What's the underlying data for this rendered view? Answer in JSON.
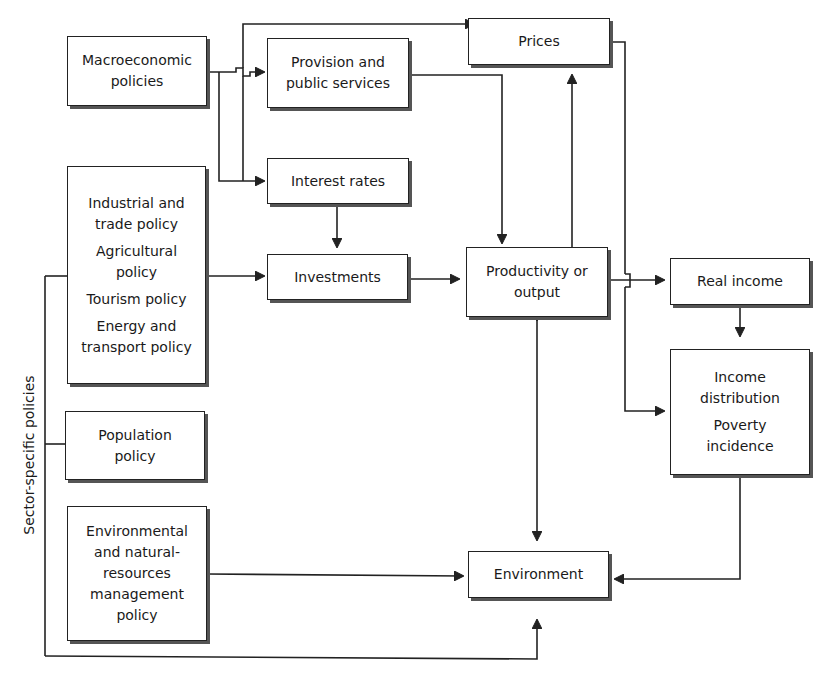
{
  "diagram": {
    "side_label": "Sector-specific policies",
    "nodes": {
      "macro": {
        "lines": [
          "Macroeconomic",
          "policies"
        ]
      },
      "provision": {
        "lines": [
          "Provision and",
          "public services"
        ]
      },
      "prices": {
        "lines": [
          "Prices"
        ]
      },
      "interest": {
        "lines": [
          "Interest rates"
        ]
      },
      "sector": {
        "groups": [
          [
            "Industrial and",
            "trade policy"
          ],
          [
            "Agricultural",
            "policy"
          ],
          [
            "Tourism policy"
          ],
          [
            "Energy and",
            "transport policy"
          ]
        ]
      },
      "investments": {
        "lines": [
          "Investments"
        ]
      },
      "productivity": {
        "lines": [
          "Productivity or",
          "output"
        ]
      },
      "real_income": {
        "lines": [
          "Real income"
        ]
      },
      "income_dist": {
        "groups": [
          [
            "Income",
            "distribution"
          ],
          [
            "Poverty",
            "incidence"
          ]
        ]
      },
      "population": {
        "lines": [
          "Population",
          "policy"
        ]
      },
      "env_policy": {
        "lines": [
          "Environmental",
          "and natural-",
          "resources",
          "management",
          "policy"
        ]
      },
      "environment": {
        "lines": [
          "Environment"
        ]
      }
    },
    "edges": [
      {
        "from": "Macroeconomic policies",
        "to": "Prices"
      },
      {
        "from": "Macroeconomic policies",
        "to": "Provision and public services"
      },
      {
        "from": "Macroeconomic policies",
        "to": "Interest rates"
      },
      {
        "from": "Provision and public services",
        "to": "Productivity or output"
      },
      {
        "from": "Interest rates",
        "to": "Investments"
      },
      {
        "from": "Sector-specific policies",
        "to": "Investments"
      },
      {
        "from": "Investments",
        "to": "Productivity or output"
      },
      {
        "from": "Productivity or output",
        "to": "Prices"
      },
      {
        "from": "Productivity or output",
        "to": "Real income"
      },
      {
        "from": "Prices",
        "to": "Real income"
      },
      {
        "from": "Prices",
        "to": "Income distribution / Poverty incidence"
      },
      {
        "from": "Real income",
        "to": "Income distribution / Poverty incidence"
      },
      {
        "from": "Productivity or output",
        "to": "Environment",
        "bidirectional": true
      },
      {
        "from": "Environmental and natural-resources management policy",
        "to": "Environment"
      },
      {
        "from": "Income distribution / Poverty incidence",
        "to": "Environment"
      },
      {
        "from": "Sector-specific policies",
        "to": "Environment"
      }
    ]
  }
}
